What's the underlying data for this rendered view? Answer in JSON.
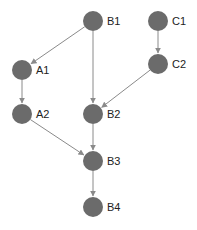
{
  "diagram": {
    "type": "directed-graph",
    "node_color": "#6b6b6b",
    "edge_color": "#8a8a8a",
    "nodes": [
      {
        "id": "B1",
        "label": "B1",
        "x": 93,
        "y": 21
      },
      {
        "id": "C1",
        "label": "C1",
        "x": 158,
        "y": 21
      },
      {
        "id": "A1",
        "label": "A1",
        "x": 22,
        "y": 70
      },
      {
        "id": "C2",
        "label": "C2",
        "x": 158,
        "y": 64
      },
      {
        "id": "A2",
        "label": "A2",
        "x": 22,
        "y": 114
      },
      {
        "id": "B2",
        "label": "B2",
        "x": 93,
        "y": 114
      },
      {
        "id": "B3",
        "label": "B3",
        "x": 93,
        "y": 161
      },
      {
        "id": "B4",
        "label": "B4",
        "x": 93,
        "y": 207
      }
    ],
    "edges": [
      {
        "from": "B1",
        "to": "A1"
      },
      {
        "from": "B1",
        "to": "B2"
      },
      {
        "from": "C1",
        "to": "C2"
      },
      {
        "from": "C2",
        "to": "B2"
      },
      {
        "from": "A1",
        "to": "A2"
      },
      {
        "from": "A2",
        "to": "B3"
      },
      {
        "from": "B2",
        "to": "B3"
      },
      {
        "from": "B3",
        "to": "B4"
      }
    ]
  }
}
